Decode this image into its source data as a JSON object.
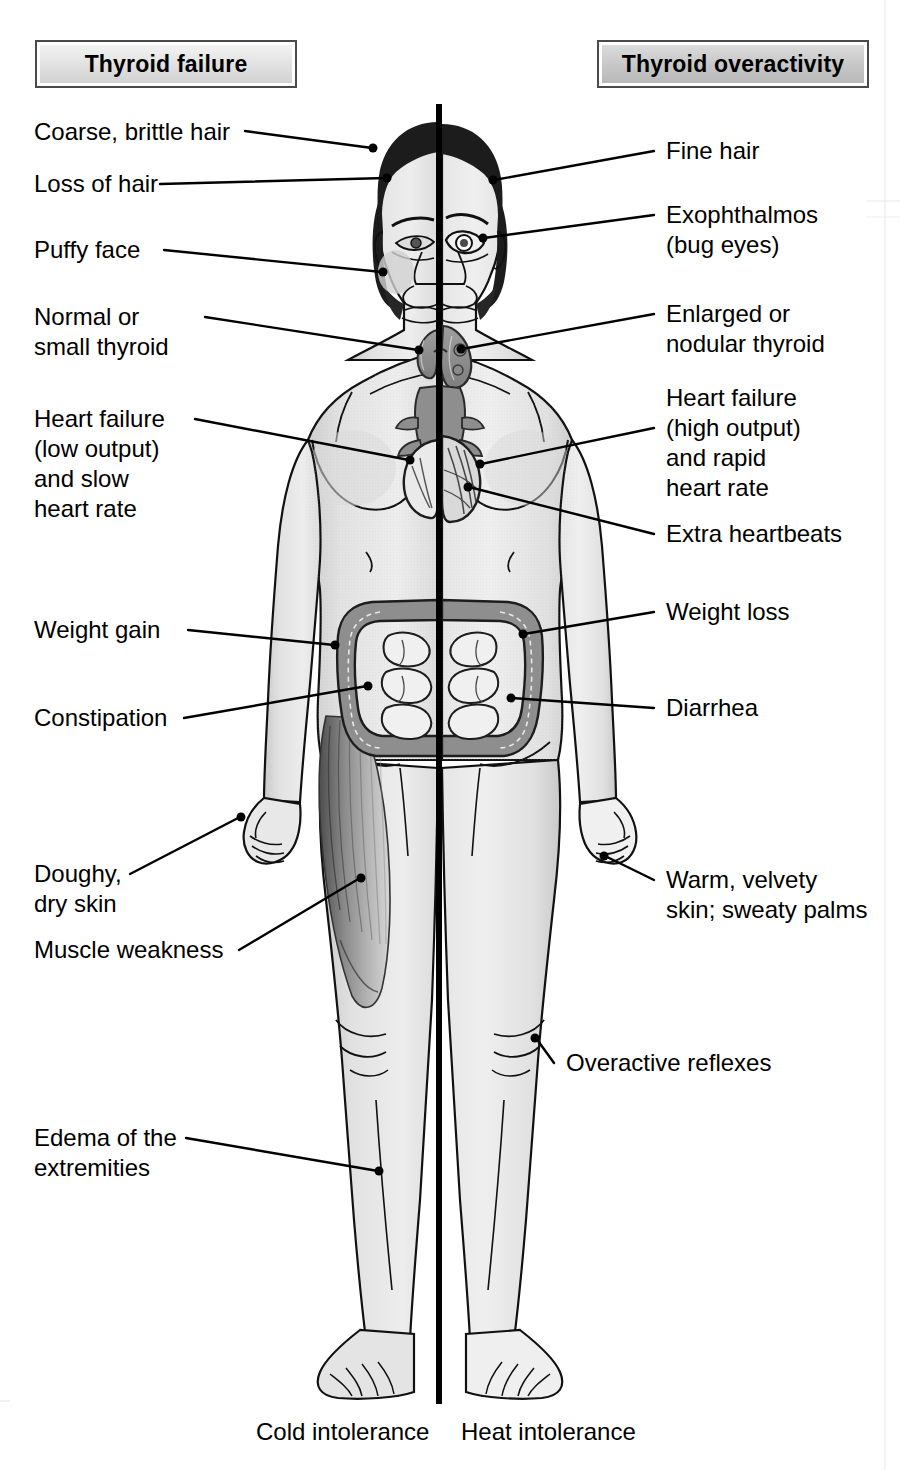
{
  "figure": {
    "title_left": "Thyroid failure",
    "title_right": "Thyroid overactivity",
    "caption_left": "Cold intolerance",
    "caption_right": "Heat intolerance",
    "colors": {
      "ink": "#000000",
      "header_border": "#4a4a4a",
      "skin_light": "#ebebeb",
      "skin_mid": "#d8d8d8",
      "skin_shade": "#c2c2c2",
      "organ_dark": "#8e8e8e",
      "organ_mid": "#a9a9a9",
      "hair_dark": "#1a1a1a",
      "muscle": "#777777"
    }
  },
  "left_labels": [
    {
      "id": "coarse-brittle-hair",
      "text": "Coarse, brittle hair"
    },
    {
      "id": "loss-of-hair",
      "text": "Loss of hair"
    },
    {
      "id": "puffy-face",
      "text": "Puffy face"
    },
    {
      "id": "normal-small-thyroid",
      "text": "Normal or\nsmall thyroid"
    },
    {
      "id": "heart-failure-low",
      "text": "Heart failure\n(low output)\nand slow\nheart rate"
    },
    {
      "id": "weight-gain",
      "text": "Weight gain"
    },
    {
      "id": "constipation",
      "text": "Constipation"
    },
    {
      "id": "doughy-dry-skin",
      "text": "Doughy,\ndry skin"
    },
    {
      "id": "muscle-weakness",
      "text": "Muscle weakness"
    },
    {
      "id": "edema-extremities",
      "text": "Edema of the\nextremities"
    }
  ],
  "right_labels": [
    {
      "id": "fine-hair",
      "text": "Fine hair"
    },
    {
      "id": "exophthalmos",
      "text": "Exophthalmos\n(bug eyes)"
    },
    {
      "id": "enlarged-thyroid",
      "text": "Enlarged or\nnodular thyroid"
    },
    {
      "id": "heart-failure-high",
      "text": "Heart failure\n(high output)\nand rapid\nheart rate"
    },
    {
      "id": "extra-heartbeats",
      "text": "Extra heartbeats"
    },
    {
      "id": "weight-loss",
      "text": "Weight loss"
    },
    {
      "id": "diarrhea",
      "text": "Diarrhea"
    },
    {
      "id": "warm-velvety-skin",
      "text": "Warm, velvety\nskin; sweaty palms"
    },
    {
      "id": "overactive-reflexes",
      "text": "Overactive reflexes"
    }
  ]
}
